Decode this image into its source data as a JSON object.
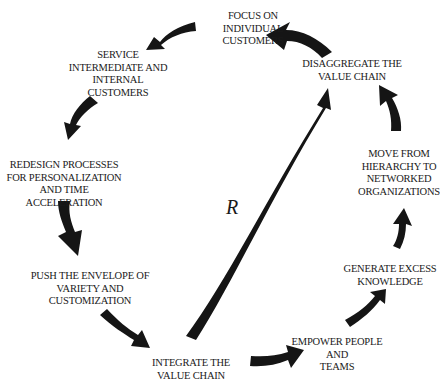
{
  "diagram": {
    "type": "reinforcing-loop",
    "center_label": "R",
    "arrow_color": "#151515",
    "text_color": "#1a1a1a",
    "nodes": [
      {
        "id": "focus",
        "text": "FOCUS ON\nINDIVIDUAL\nCUSTOMERS"
      },
      {
        "id": "service",
        "text": "SERVICE\nINTERMEDIATE AND\nINTERNAL\nCUSTOMERS"
      },
      {
        "id": "redesign",
        "text": "REDESIGN PROCESSES\nFOR PERSONALIZATION\nAND TIME ACCELERATION"
      },
      {
        "id": "push",
        "text": "PUSH THE ENVELOPE OF\nVARIETY AND\nCUSTOMIZATION"
      },
      {
        "id": "integrate",
        "text": "INTEGRATE THE\nVALUE CHAIN"
      },
      {
        "id": "empower",
        "text": "EMPOWER PEOPLE AND\nTEAMS"
      },
      {
        "id": "generate",
        "text": "GENERATE EXCESS\nKNOWLEDGE"
      },
      {
        "id": "move",
        "text": "MOVE FROM\nHIERARCHY TO\nNETWORKED\nORGANIZATIONS"
      },
      {
        "id": "disaggregate",
        "text": "DISAGGREGATE THE\nVALUE CHAIN"
      }
    ],
    "edges": [
      {
        "from": "focus",
        "to": "service"
      },
      {
        "from": "service",
        "to": "redesign"
      },
      {
        "from": "redesign",
        "to": "push"
      },
      {
        "from": "push",
        "to": "integrate"
      },
      {
        "from": "integrate",
        "to": "empower"
      },
      {
        "from": "empower",
        "to": "generate"
      },
      {
        "from": "generate",
        "to": "move"
      },
      {
        "from": "move",
        "to": "disaggregate"
      },
      {
        "from": "disaggregate",
        "to": "focus"
      },
      {
        "from": "integrate",
        "to": "disaggregate"
      }
    ]
  }
}
